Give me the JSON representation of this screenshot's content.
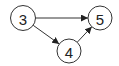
{
  "graph": {
    "nodes": [
      {
        "id": "3",
        "label": "3",
        "cx": 23,
        "cy": 18,
        "r": 12.5
      },
      {
        "id": "5",
        "label": "5",
        "cx": 100,
        "cy": 18,
        "r": 12
      },
      {
        "id": "4",
        "label": "4",
        "cx": 69,
        "cy": 51,
        "r": 12
      }
    ],
    "edges": [
      {
        "from": "3",
        "to": "5"
      },
      {
        "from": "3",
        "to": "4"
      },
      {
        "from": "4",
        "to": "5"
      }
    ],
    "colors": {
      "stroke": "#333333",
      "fill": "#ffffff",
      "text": "#222222"
    }
  }
}
